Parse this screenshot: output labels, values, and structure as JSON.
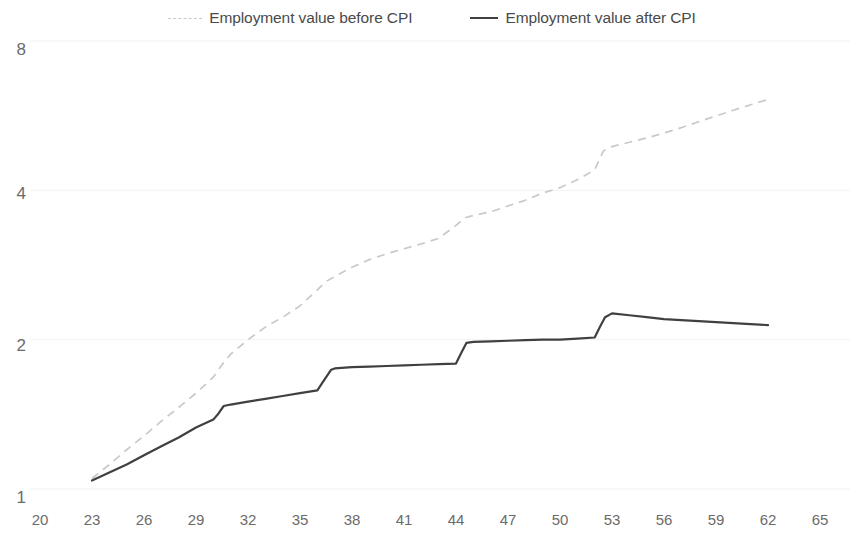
{
  "legend": {
    "entries": [
      {
        "label": "Employment value before CPI",
        "style": "dashed",
        "icon": "dashed-line-icon",
        "color": "#c9c9c9"
      },
      {
        "label": "Employment value after CPI",
        "style": "solid",
        "icon": "solid-line-icon",
        "color": "#404040"
      }
    ]
  },
  "axes": {
    "y": {
      "ticks": [
        "8",
        "4",
        "2",
        "1"
      ],
      "scale": "log"
    },
    "x": {
      "ticks": [
        "20",
        "23",
        "26",
        "29",
        "32",
        "35",
        "38",
        "41",
        "44",
        "47",
        "50",
        "53",
        "56",
        "59",
        "62",
        "65"
      ]
    }
  },
  "colors": {
    "before_cpi": "#c9c9c9",
    "after_cpi": "#404040",
    "gridline": "#f2f2f2",
    "text": "#6b6b6b"
  },
  "chart_data": {
    "type": "line",
    "title": "",
    "xlabel": "",
    "ylabel": "",
    "ylim": [
      1,
      8
    ],
    "yscale": "log",
    "yticks": [
      1,
      2,
      4,
      8
    ],
    "xlim": [
      20,
      65
    ],
    "xticks": [
      20,
      23,
      26,
      29,
      32,
      35,
      38,
      41,
      44,
      47,
      50,
      53,
      56,
      59,
      62,
      65
    ],
    "grid": true,
    "legend_position": "top-center",
    "series": [
      {
        "name": "Employment value before CPI",
        "style": "dashed",
        "color": "#c9c9c9",
        "x": [
          23,
          24,
          25,
          26,
          27,
          28,
          29,
          30,
          30.5,
          31,
          32,
          33,
          34,
          35,
          36,
          36.5,
          37,
          38,
          39,
          40,
          41,
          42,
          43,
          44,
          44.5,
          45,
          46,
          47,
          48,
          49,
          50,
          51,
          52,
          52.5,
          53,
          54,
          55,
          56,
          57,
          58,
          59,
          60,
          61,
          62
        ],
        "y": [
          1.05,
          1.12,
          1.2,
          1.28,
          1.37,
          1.46,
          1.56,
          1.68,
          1.78,
          1.87,
          2.0,
          2.12,
          2.22,
          2.34,
          2.52,
          2.62,
          2.68,
          2.8,
          2.9,
          2.98,
          3.05,
          3.12,
          3.2,
          3.4,
          3.52,
          3.56,
          3.62,
          3.72,
          3.82,
          3.95,
          4.05,
          4.2,
          4.4,
          4.8,
          4.9,
          5.0,
          5.1,
          5.22,
          5.35,
          5.5,
          5.65,
          5.8,
          5.95,
          6.1
        ]
      },
      {
        "name": "Employment value after CPI",
        "style": "solid",
        "color": "#404040",
        "x": [
          23,
          24,
          25,
          26,
          27,
          28,
          29,
          30,
          30.3,
          30.6,
          31,
          32,
          33,
          34,
          35,
          36,
          36.4,
          36.8,
          37,
          38,
          39,
          40,
          41,
          42,
          43,
          44,
          44.3,
          44.6,
          45,
          46,
          47,
          48,
          49,
          50,
          51,
          52,
          52.3,
          52.6,
          53,
          54,
          55,
          56,
          57,
          58,
          59,
          60,
          61,
          62
        ],
        "y": [
          1.04,
          1.08,
          1.12,
          1.17,
          1.22,
          1.27,
          1.33,
          1.38,
          1.42,
          1.47,
          1.48,
          1.5,
          1.52,
          1.54,
          1.56,
          1.58,
          1.66,
          1.74,
          1.75,
          1.76,
          1.765,
          1.77,
          1.775,
          1.78,
          1.785,
          1.79,
          1.88,
          1.97,
          1.98,
          1.985,
          1.99,
          1.995,
          2.0,
          2.0,
          2.01,
          2.02,
          2.12,
          2.22,
          2.26,
          2.24,
          2.22,
          2.2,
          2.19,
          2.18,
          2.17,
          2.16,
          2.15,
          2.14
        ]
      }
    ]
  }
}
